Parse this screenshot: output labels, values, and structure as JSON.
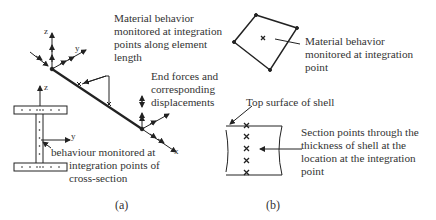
{
  "panel_a": {
    "caption": "(a)",
    "axes": {
      "z_top": "z",
      "y_top": "y",
      "x_end": "x",
      "z_section": "z",
      "y_section": "y"
    },
    "labels": {
      "material_line1": "Material behavior",
      "material_line2": "monitored at integration",
      "material_line3": "points along element",
      "material_line4": "length",
      "end_line1": "End forces and",
      "end_line2": "corresponding",
      "end_line3": "displacements",
      "section_line1": "behaviour monitored at",
      "section_line2": "integration points of",
      "section_line3": "cross-section"
    }
  },
  "panel_b": {
    "caption": "(b)",
    "labels": {
      "mat_line1": "Material behavior",
      "mat_line2": "monitored at integration",
      "mat_line3": "point",
      "top_surface": "Top surface of shell",
      "sec_line1": "Section points through the",
      "sec_line2": "thickness of shell at the",
      "sec_line3": "location at the integration",
      "sec_line4": "point"
    },
    "section_points_count": 5
  },
  "colors": {
    "line": "#222222",
    "text": "#333333",
    "background": "#ffffff"
  }
}
